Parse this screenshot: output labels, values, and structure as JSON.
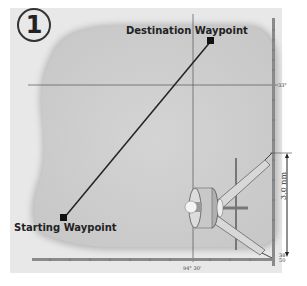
{
  "step_number": "1",
  "labels": {
    "destination": "Destination Waypoint",
    "starting": "Starting Waypoint",
    "distance": "3.0 nm",
    "latitude_right": "33°",
    "longitude_bottom": "94° 30'",
    "corner_label": "38 50"
  },
  "colors": {
    "background": "#ffffff",
    "panel": "#e6e6e6",
    "land": "#cfcfcf",
    "line": "#333333",
    "ruler": "#8a8a8a"
  },
  "icons": {
    "waypoint": "square-marker-icon",
    "tool": "dividers-compass-icon"
  }
}
